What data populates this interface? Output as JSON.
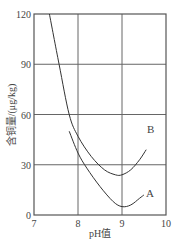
{
  "chart_data": {
    "type": "line",
    "title": "",
    "xlabel": "pH值",
    "ylabel": "含铜量/(μg/kg)",
    "xlim": [
      7,
      10
    ],
    "ylim": [
      0,
      120
    ],
    "x_ticks": [
      "7",
      "8",
      "9",
      "10"
    ],
    "y_ticks": [
      "0",
      "30",
      "60",
      "90",
      "120"
    ],
    "grid": true,
    "legend": "inline labels at curve ends",
    "series": [
      {
        "name": "B",
        "points": [
          [
            7.35,
            120
          ],
          [
            7.57,
            90
          ],
          [
            7.8,
            60
          ],
          [
            8.0,
            47
          ],
          [
            8.3,
            35
          ],
          [
            8.6,
            27
          ],
          [
            8.85,
            24
          ],
          [
            9.0,
            24
          ],
          [
            9.2,
            27
          ],
          [
            9.4,
            33
          ],
          [
            9.55,
            39
          ]
        ]
      },
      {
        "name": "A",
        "points": [
          [
            7.8,
            50
          ],
          [
            8.0,
            37
          ],
          [
            8.2,
            28
          ],
          [
            8.5,
            17
          ],
          [
            8.8,
            8
          ],
          [
            9.0,
            5
          ],
          [
            9.2,
            6
          ],
          [
            9.4,
            10
          ],
          [
            9.5,
            12
          ]
        ]
      }
    ]
  },
  "labels": {
    "x_axis": "pH值",
    "y_axis": "含铜量/(μg/kg)",
    "curve_a": "A",
    "curve_b": "B"
  },
  "colors": {
    "axis": "#555555",
    "grid": "#666666",
    "curve": "#333333"
  }
}
